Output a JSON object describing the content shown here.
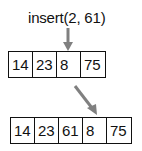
{
  "operation": {
    "label": "insert(2, 61)",
    "index": 2,
    "value": 61
  },
  "before": {
    "cells": [
      "14",
      "23",
      "8",
      "75"
    ]
  },
  "after": {
    "cells": [
      "14",
      "23",
      "61",
      "8",
      "75"
    ]
  },
  "colors": {
    "arrow": "#808080",
    "border": "#111111"
  }
}
